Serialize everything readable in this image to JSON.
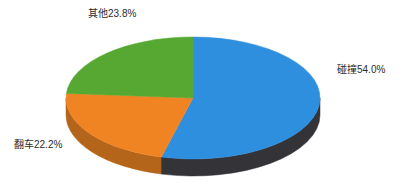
{
  "background_color": "#ffffff",
  "labels": {
    "other": "其他23.8%",
    "collision": "碰撞54.0%",
    "rollover": "翻车22.2%"
  },
  "chart_data": {
    "type": "pie",
    "title": "",
    "xlabel": "",
    "ylabel": "",
    "three_d": true,
    "start_angle_clock": "12 o'clock",
    "direction": "clockwise",
    "legend": "none",
    "grid": false,
    "labels_position": "outside",
    "categories": [
      "碰撞",
      "翻车",
      "其他"
    ],
    "values": [
      54.0,
      22.2,
      23.8
    ],
    "value_unit": "%",
    "total": 100.0,
    "data_labels": [
      "碰撞54.0%",
      "翻车22.2%",
      "其他23.8%"
    ],
    "colors": [
      "#2e8fde",
      "#f08422",
      "#56a832"
    ],
    "side_colors": [
      "#333338",
      "#b5651a",
      "#3d7722"
    ],
    "slices": [
      {
        "name": "碰撞",
        "value": 54.0,
        "label": "碰撞54.0%",
        "color": "#2e8fde",
        "side_color": "#333338",
        "label_anchor": "right"
      },
      {
        "name": "翻车",
        "value": 22.2,
        "label": "翻车22.2%",
        "color": "#f08422",
        "side_color": "#b5651a",
        "label_anchor": "bottom-left"
      },
      {
        "name": "其他",
        "value": 23.8,
        "label": "其他23.8%",
        "color": "#56a832",
        "side_color": "#3d7722",
        "label_anchor": "top-left"
      }
    ]
  }
}
